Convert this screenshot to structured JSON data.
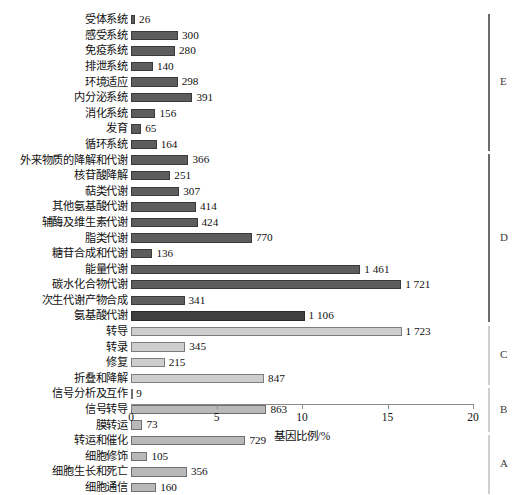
{
  "chart_data": {
    "type": "bar",
    "orientation": "horizontal",
    "title": "",
    "subtitle": "",
    "xlabel": "基因比例/%",
    "ylabel": "",
    "xlim": [
      0,
      20
    ],
    "xticks": [
      0,
      5,
      10,
      15,
      20
    ],
    "xtick_labels": [
      "0",
      "5",
      "10",
      "15",
      "20"
    ],
    "grid": false,
    "legend_position": "none",
    "value_unit": "基因数",
    "categories": [
      "受体系统",
      "感受系统",
      "免疫系统",
      "排泄系统",
      "环境适应",
      "内分泌系统",
      "消化系统",
      "发育",
      "循环系统",
      "外来物质的降解和代谢",
      "核苷酸降解",
      "萜类代谢",
      "其他氨基酸代谢",
      "辅酶及维生素代谢",
      "脂类代谢",
      "糖苷合成和代谢",
      "能量代谢",
      "碳水化合物代谢",
      "次生代谢产物合成",
      "氨基酸代谢",
      "转导",
      "转录",
      "修复",
      "折叠和降解",
      "信号分析及互作",
      "信号转导",
      "膜转运",
      "转运和催化",
      "细胞修饰",
      "细胞生长和死亡",
      "细胞通信"
    ],
    "values": [
      26,
      300,
      280,
      140,
      298,
      391,
      156,
      65,
      164,
      366,
      251,
      307,
      414,
      424,
      770,
      136,
      1461,
      1721,
      341,
      1106,
      1723,
      345,
      215,
      847,
      9,
      863,
      73,
      729,
      105,
      356,
      160
    ],
    "value_labels": [
      "26",
      "300",
      "280",
      "140",
      "298",
      "391",
      "156",
      "65",
      "164",
      "366",
      "251",
      "307",
      "414",
      "424",
      "770",
      "136",
      "1 461",
      "1 721",
      "341",
      "1 106",
      "1 723",
      "345",
      "215",
      "847",
      "9",
      "863",
      "73",
      "729",
      "105",
      "356",
      "160"
    ],
    "percentages": [
      0.24,
      2.75,
      2.57,
      1.28,
      2.73,
      3.59,
      1.43,
      0.6,
      1.5,
      3.36,
      2.3,
      2.82,
      3.8,
      3.89,
      7.07,
      1.25,
      13.41,
      15.8,
      3.13,
      10.15,
      15.82,
      3.17,
      1.97,
      7.78,
      0.08,
      7.92,
      0.67,
      6.69,
      0.96,
      3.27,
      1.47
    ],
    "bar_styles": [
      "dark",
      "dark",
      "dark",
      "dark",
      "dark",
      "dark",
      "dark",
      "dark",
      "dark",
      "dark",
      "dark",
      "dark",
      "dark",
      "dark",
      "dark",
      "dark",
      "dark",
      "dark",
      "dark",
      "darker",
      "light",
      "light",
      "light",
      "light",
      "mid",
      "mid",
      "mid",
      "mid",
      "mid",
      "mid",
      "mid"
    ],
    "group_brackets": [
      {
        "letter": "E",
        "start_index": 0,
        "end_index": 8,
        "style": "heavy"
      },
      {
        "letter": "D",
        "start_index": 9,
        "end_index": 19,
        "style": "heavy"
      },
      {
        "letter": "C",
        "start_index": 20,
        "end_index": 23,
        "style": "lightl"
      },
      {
        "letter": "B",
        "start_index": 24,
        "end_index": 26,
        "style": "lightl"
      },
      {
        "letter": "A",
        "start_index": 27,
        "end_index": 30,
        "style": "lightl"
      }
    ],
    "colors": {
      "bar_dark": "#5d5d5d",
      "bar_darker": "#3f3f3f",
      "bar_light": "#cdcdcd",
      "bar_mid": "#b9b9b9",
      "axis": "#8a8a8a",
      "text": "#111111",
      "bracket_heavy": "#6b6b6b",
      "bracket_light": "#cfcfcf"
    }
  }
}
